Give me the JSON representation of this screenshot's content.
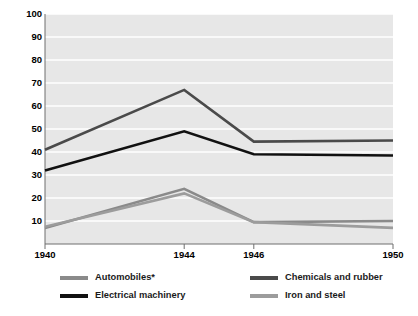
{
  "chart_data": {
    "type": "line",
    "title": "",
    "xlabel": "",
    "ylabel": "Women as a percentage of all production workers",
    "categories": [
      "1940",
      "1944",
      "1946",
      "1950"
    ],
    "x": [
      1940,
      1944,
      1946,
      1950
    ],
    "xlim": [
      1940,
      1950
    ],
    "ylim": [
      0,
      100
    ],
    "yticks": [
      "10",
      "20",
      "30",
      "40",
      "50",
      "60",
      "70",
      "80",
      "90",
      "100"
    ],
    "ytick_values": [
      10,
      20,
      30,
      40,
      50,
      60,
      70,
      80,
      90,
      100
    ],
    "grid": "horizontal-white-on-gray",
    "legend_position": "bottom",
    "series": [
      {
        "name": "Automobiles*",
        "values": [
          7,
          24,
          9.5,
          10
        ],
        "color": "#8a8a8a"
      },
      {
        "name": "Chemicals and rubber",
        "values": [
          41,
          67,
          44.5,
          45
        ],
        "color": "#4a4a4a"
      },
      {
        "name": "Electrical machinery",
        "values": [
          32,
          49,
          39,
          38.5
        ],
        "color": "#111111"
      },
      {
        "name": "Iron and steel",
        "values": [
          7.5,
          22,
          9.5,
          7
        ],
        "color": "#9c9c9c"
      }
    ]
  },
  "legend": {
    "items": [
      {
        "label": "Automobiles*",
        "color": "#8a8a8a"
      },
      {
        "label": "Chemicals and rubber",
        "color": "#4a4a4a"
      },
      {
        "label": "Electrical machinery",
        "color": "#111111"
      },
      {
        "label": "Iron and steel",
        "color": "#9c9c9c"
      }
    ]
  },
  "colors": {
    "plot_background": "#e7e7e7",
    "gridline": "#ffffff",
    "axis": "#6f6f6f",
    "text": "#000000"
  }
}
